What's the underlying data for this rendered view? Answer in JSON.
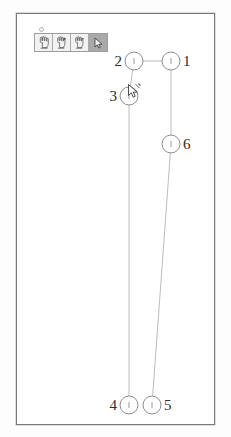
{
  "app": {
    "title": "Graph Editor Canvas",
    "background_color": "#ffffff",
    "frame_color": "#7a7a7a"
  },
  "toolbar": {
    "handle_label": "",
    "selected_index": 3,
    "buttons": [
      {
        "icon": "hand-pointer-icon",
        "label": "",
        "selected": false
      },
      {
        "icon": "hand-add-icon",
        "label": "",
        "selected": false
      },
      {
        "icon": "hand-remove-icon",
        "label": "",
        "selected": false
      },
      {
        "icon": "arrow-cursor-icon",
        "label": "",
        "selected": true
      }
    ]
  },
  "cursor": {
    "icon": "arrow-cursor-icon",
    "x": 126,
    "y": 83
  },
  "graph": {
    "node_radius": 9,
    "node_fill": "#ffffff",
    "node_stroke": "#8d8d8d",
    "edge_color": "#b4b4b4",
    "label_color": "#2b2b2b",
    "nodes": [
      {
        "id": "1",
        "label": "1",
        "x": 154,
        "y": 47,
        "label_side": "right"
      },
      {
        "id": "2",
        "label": "2",
        "x": 117,
        "y": 47,
        "label_side": "left"
      },
      {
        "id": "3",
        "label": "3",
        "x": 112,
        "y": 82,
        "label_side": "left"
      },
      {
        "id": "4",
        "label": "4",
        "x": 112,
        "y": 391,
        "label_side": "left"
      },
      {
        "id": "5",
        "label": "5",
        "x": 135,
        "y": 391,
        "label_side": "right"
      },
      {
        "id": "6",
        "label": "6",
        "x": 154,
        "y": 130,
        "label_side": "right"
      }
    ],
    "edges": [
      {
        "from": "2",
        "to": "1"
      },
      {
        "from": "2",
        "to": "3"
      },
      {
        "from": "3",
        "to": "4"
      },
      {
        "from": "1",
        "to": "6"
      },
      {
        "from": "6",
        "to": "5"
      }
    ]
  }
}
